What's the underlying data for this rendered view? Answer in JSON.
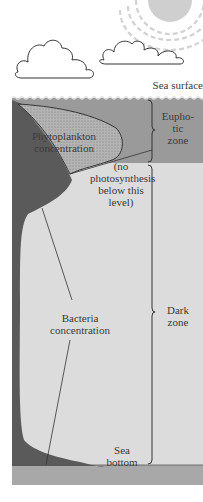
{
  "labels": {
    "sea_surface": "Sea surface",
    "euphotic_zone": [
      "Eupho-",
      "tic",
      "zone"
    ],
    "phytoplankton": [
      "Phytoplankton",
      "concentration"
    ],
    "no_photosynthesis": [
      "(no",
      "photosynthesis",
      "below this",
      "level)"
    ],
    "dark_zone": [
      "Dark",
      "zone"
    ],
    "bacteria": [
      "Bacteria",
      "concentration"
    ],
    "sea_bottom": [
      "Sea",
      "bottom"
    ]
  },
  "colors": {
    "euphotic_band": "#9a9a9a",
    "dark_zone_water": "#dcdcdc",
    "bacteria_fill": "#5a5a5a",
    "phytoplankton_fill": "#b4b4b4",
    "sea_floor": "#a8a8a8",
    "sun": "#cfcfcf"
  }
}
